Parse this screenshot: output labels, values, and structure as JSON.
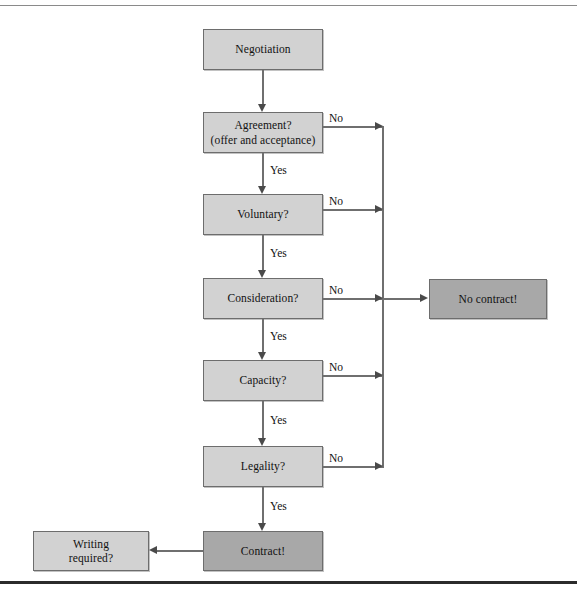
{
  "figure": {
    "colors": {
      "box_light": "#d2d2d2",
      "box_dark": "#a8a8a8",
      "box_border": "#6d6d6d",
      "connector": "#6f6f6f",
      "arrowhead": "#4a4a4a",
      "text": "#111111",
      "rule_top": "#8a8a8a",
      "rule_bottom": "#2b2b2b",
      "background": "#ffffff"
    }
  },
  "nodes": {
    "negotiation": {
      "label": "Negotiation",
      "shade": "light"
    },
    "agreement": {
      "label_line1": "Agreement?",
      "label_line2": "(offer and acceptance)",
      "shade": "light"
    },
    "voluntary": {
      "label": "Voluntary?",
      "shade": "light"
    },
    "consideration": {
      "label": "Consideration?",
      "shade": "light"
    },
    "capacity": {
      "label": "Capacity?",
      "shade": "light"
    },
    "legality": {
      "label": "Legality?",
      "shade": "light"
    },
    "contract": {
      "label": "Contract!",
      "shade": "dark"
    },
    "no_contract": {
      "label": "No contract!",
      "shade": "dark"
    },
    "writing_required": {
      "label_line1": "Writing",
      "label_line2": "required?",
      "shade": "light"
    }
  },
  "edges": {
    "agreement_no": "No",
    "agreement_yes": "Yes",
    "voluntary_no": "No",
    "voluntary_yes": "Yes",
    "consideration_no": "No",
    "consideration_yes": "Yes",
    "capacity_no": "No",
    "capacity_yes": "Yes",
    "legality_no": "No",
    "legality_yes": "Yes"
  }
}
